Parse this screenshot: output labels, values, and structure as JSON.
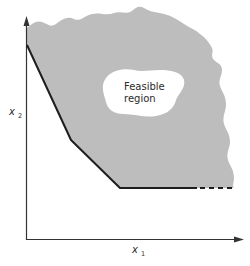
{
  "diagram": {
    "type": "feasible-region-sketch",
    "region_label_line1": "Feasible",
    "region_label_line2": "region",
    "x_axis": {
      "label": "x",
      "subscript": "1"
    },
    "y_axis": {
      "label": "x",
      "subscript": "2"
    },
    "colors": {
      "region_fill": "#bdbdbd",
      "boundary": "#1e1e1e",
      "axis": "#333333",
      "hole": "#ffffff"
    },
    "boundary_style": {
      "solid_segments": 3,
      "dashed_continuation": true,
      "description": "piecewise-linear lower-left boundary: steep edge, gentler edge, horizontal edge continuing dashed"
    }
  }
}
